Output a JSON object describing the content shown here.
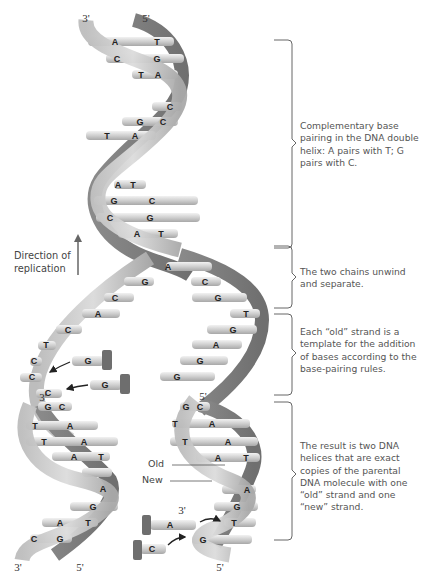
{
  "figure": {
    "colors": {
      "backbone_light": "#c9c9c9",
      "backbone_mid": "#a9a9a9",
      "backbone_dark": "#7d7d7d",
      "base_fill": "#d6d6d6",
      "base_highlight": "#eeeeee",
      "nucleotide_cap": "#6e6e6e",
      "bracket_line": "#666666",
      "text": "#555555",
      "arrow": "#222222"
    }
  },
  "end_labels": {
    "top_left": "3'",
    "top_right": "5'",
    "bottom_left_3": "3'",
    "bottom_left_5": "5'",
    "mid_left_3": "3'",
    "mid_right_5": "5'",
    "right_3": "3'",
    "bottom_right_5": "5'"
  },
  "direction_label": {
    "line1": "Direction of",
    "line2": "replication"
  },
  "strand_tags": {
    "old": "Old",
    "new": "New"
  },
  "parental_helix": {
    "base_pairs": [
      {
        "left": "A",
        "right": "T"
      },
      {
        "left": "C",
        "right": "G"
      },
      {
        "left": "T",
        "right": "A"
      },
      {
        "left": "",
        "right": "C"
      },
      {
        "left": "G",
        "right": "C"
      },
      {
        "left": "T",
        "right": "A"
      },
      {
        "left": "A",
        "right": "T"
      },
      {
        "left": "G",
        "right": "C"
      },
      {
        "left": "C",
        "right": "G"
      },
      {
        "left": "A",
        "right": "T"
      }
    ]
  },
  "unwound_region": {
    "left_strand_bases": [
      "G",
      "C",
      "A",
      "C",
      "T",
      "C",
      "C",
      "C"
    ],
    "right_strand_bases": [
      "A",
      "C",
      "G",
      "T",
      "G",
      "A",
      "G",
      "G"
    ],
    "incoming_nucleotides_left": [
      "G",
      "G"
    ]
  },
  "daughter_left": {
    "base_pairs": [
      {
        "left": "G",
        "right": "C"
      },
      {
        "left": "T",
        "right": "A"
      },
      {
        "left": "T",
        "right": "A"
      },
      {
        "left": "A",
        "right": "T"
      },
      {
        "left": "",
        "right": "A"
      },
      {
        "left": "",
        "right": "G"
      },
      {
        "left": "A",
        "right": "T"
      },
      {
        "left": "C",
        "right": "G"
      }
    ]
  },
  "daughter_right": {
    "base_pairs": [
      {
        "left": "G",
        "right": "C"
      },
      {
        "left": "T",
        "right": "A"
      },
      {
        "left": "T",
        "right": "A"
      },
      {
        "left": "A",
        "right": "T"
      },
      {
        "left": "",
        "right": "A"
      },
      {
        "left": "",
        "right": "G"
      },
      {
        "left": "",
        "right": "T"
      },
      {
        "left": "",
        "right": "G"
      }
    ],
    "incoming_nucleotides": [
      "A",
      "C"
    ]
  },
  "annotations": [
    {
      "id": "pairing",
      "text": "Complementary base pairing in the DNA double helix: A pairs with T; G pairs with C."
    },
    {
      "id": "unwind",
      "text": "The two chains unwind and separate."
    },
    {
      "id": "template",
      "text": "Each “old” strand is a template for the addition of bases according to the base-pairing rules."
    },
    {
      "id": "result",
      "text": "The result is two DNA helices that are exact copies of the parental DNA molecule with one “old” strand and one “new” strand."
    }
  ]
}
